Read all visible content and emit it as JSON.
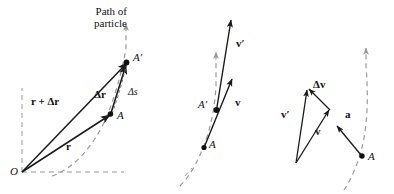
{
  "figure": {
    "title": "",
    "background": "#ffffff",
    "ink_color": "#1a1a1a",
    "dash_color": "#9a9a9a",
    "width": 394,
    "height": 194
  },
  "panels": [
    {
      "id": "panel-displacement",
      "name": "position-and-displacement-panel",
      "labels": {
        "path_line1": "Path of",
        "path_line2": "particle",
        "origin": "O",
        "point_a": "A",
        "point_a_prime": "A′",
        "vector_r": "r",
        "vector_r_plus_dr": "r + Δr",
        "vector_dr": "Δr",
        "arc_ds": "Δs"
      }
    },
    {
      "id": "panel-velocity",
      "name": "velocity-panel",
      "labels": {
        "point_a": "A",
        "point_a_prime": "A′",
        "vector_v": "v",
        "vector_v_prime": "v′"
      }
    },
    {
      "id": "panel-acceleration",
      "name": "acceleration-panel",
      "labels": {
        "vector_v": "v",
        "vector_v_prime": "v′",
        "vector_dv": "Δv",
        "vector_a": "a",
        "point_a": "A"
      }
    }
  ]
}
